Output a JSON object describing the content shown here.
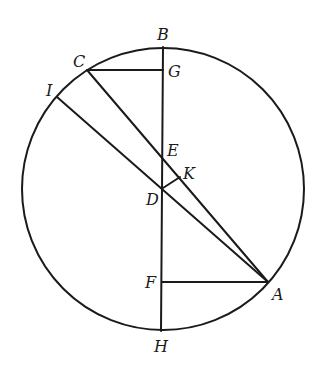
{
  "diagram": {
    "type": "geometry-circle-construction",
    "circle": {
      "cx": 163,
      "cy": 189,
      "r": 141
    },
    "points": {
      "A": {
        "x": 268,
        "y": 282,
        "label": "A",
        "lx": 272,
        "ly": 300
      },
      "B": {
        "x": 163,
        "y": 47,
        "label": "B",
        "lx": 157,
        "ly": 40
      },
      "C": {
        "x": 87,
        "y": 70,
        "label": "C",
        "lx": 73,
        "ly": 67
      },
      "D": {
        "x": 163,
        "y": 188,
        "label": "D",
        "lx": 146,
        "ly": 205
      },
      "E": {
        "x": 163,
        "y": 160,
        "label": "E",
        "lx": 167,
        "ly": 156
      },
      "F": {
        "x": 162,
        "y": 282,
        "label": "F",
        "lx": 145,
        "ly": 288
      },
      "G": {
        "x": 163,
        "y": 70,
        "label": "G",
        "lx": 168,
        "ly": 77
      },
      "H": {
        "x": 161,
        "y": 331,
        "label": "H",
        "lx": 154,
        "ly": 352
      },
      "I": {
        "x": 57,
        "y": 97,
        "label": "I",
        "lx": 46,
        "ly": 96
      },
      "K": {
        "x": 180,
        "y": 177,
        "label": "K",
        "lx": 183,
        "ly": 179
      }
    },
    "segments": [
      [
        "B",
        "H"
      ],
      [
        "C",
        "G"
      ],
      [
        "C",
        "A"
      ],
      [
        "I",
        "A"
      ],
      [
        "F",
        "A"
      ],
      [
        "D",
        "K"
      ]
    ],
    "labels": [
      "A",
      "B",
      "C",
      "D",
      "E",
      "F",
      "G",
      "H",
      "I",
      "K"
    ]
  }
}
